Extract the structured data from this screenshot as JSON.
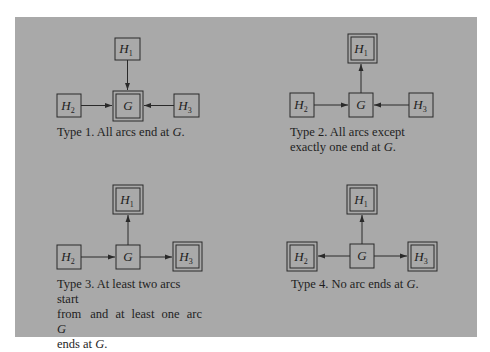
{
  "colors": {
    "background": "#a9a9a9",
    "page": "#ffffff",
    "stroke": "#2a2a2a",
    "text": "#1e1e1e"
  },
  "nodes": {
    "G": "G",
    "H1": "H",
    "H1_sub": "1",
    "H2": "H",
    "H2_sub": "2",
    "H3": "H",
    "H3_sub": "3"
  },
  "panels": [
    {
      "type": 1,
      "caption_prefix": "Type 1. All arcs end at ",
      "caption_italic": "G",
      "caption_suffix": ".",
      "edges": [
        {
          "from": "H1",
          "to": "G"
        },
        {
          "from": "H2",
          "to": "G"
        },
        {
          "from": "H3",
          "to": "G"
        }
      ],
      "double_boxed": [
        "G"
      ]
    },
    {
      "type": 2,
      "caption_line1": "Type 2. All arcs except",
      "caption_line2_prefix": "exactly one end at ",
      "caption_italic": "G",
      "caption_suffix": ".",
      "edges": [
        {
          "from": "G",
          "to": "H1"
        },
        {
          "from": "H2",
          "to": "G"
        },
        {
          "from": "H3",
          "to": "G"
        }
      ],
      "double_boxed": [
        "H1"
      ]
    },
    {
      "type": 3,
      "caption_line1": "Type 3. At least two arcs start",
      "caption_line2_prefix": "from ",
      "caption_line2_italic": "G",
      "caption_line2_suffix": " and at least one arc",
      "caption_line3_prefix": "ends at ",
      "caption_italic": "G",
      "caption_suffix": ".",
      "edges": [
        {
          "from": "G",
          "to": "H1"
        },
        {
          "from": "H2",
          "to": "G"
        },
        {
          "from": "G",
          "to": "H3"
        }
      ],
      "double_boxed": [
        "H1",
        "H3"
      ]
    },
    {
      "type": 4,
      "caption_prefix": "Type 4. No arc ends at ",
      "caption_italic": "G",
      "caption_suffix": ".",
      "edges": [
        {
          "from": "G",
          "to": "H1"
        },
        {
          "from": "G",
          "to": "H2"
        },
        {
          "from": "G",
          "to": "H3"
        }
      ],
      "double_boxed": [
        "H1",
        "H2",
        "H3"
      ]
    }
  ]
}
